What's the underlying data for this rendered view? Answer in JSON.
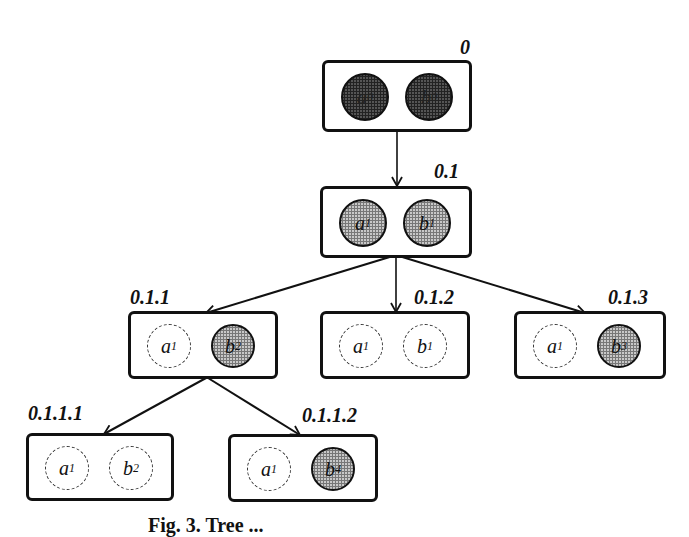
{
  "diagram": {
    "type": "tree",
    "nodes": [
      {
        "id": "0",
        "label": "0",
        "items": [
          {
            "var": "a",
            "sub": "0",
            "style": "dark"
          },
          {
            "var": "b",
            "sub": "0",
            "style": "dark"
          }
        ]
      },
      {
        "id": "0.1",
        "label": "0.1",
        "items": [
          {
            "var": "a",
            "sub": "1",
            "style": "light"
          },
          {
            "var": "b",
            "sub": "1",
            "style": "light"
          }
        ]
      },
      {
        "id": "0.1.1",
        "label": "0.1.1",
        "items": [
          {
            "var": "a",
            "sub": "1",
            "style": "dashed"
          },
          {
            "var": "b",
            "sub": "2",
            "style": "light"
          }
        ]
      },
      {
        "id": "0.1.2",
        "label": "0.1.2",
        "items": [
          {
            "var": "a",
            "sub": "1",
            "style": "dashed"
          },
          {
            "var": "b",
            "sub": "1",
            "style": "dashed"
          }
        ]
      },
      {
        "id": "0.1.3",
        "label": "0.1.3",
        "items": [
          {
            "var": "a",
            "sub": "1",
            "style": "dashed"
          },
          {
            "var": "b",
            "sub": "3",
            "style": "light"
          }
        ]
      },
      {
        "id": "0.1.1.1",
        "label": "0.1.1.1",
        "items": [
          {
            "var": "a",
            "sub": "1",
            "style": "dashed"
          },
          {
            "var": "b",
            "sub": "2",
            "style": "dashed"
          }
        ]
      },
      {
        "id": "0.1.1.2",
        "label": "0.1.1.2",
        "items": [
          {
            "var": "a",
            "sub": "1",
            "style": "dashed"
          },
          {
            "var": "b",
            "sub": "4",
            "style": "light"
          }
        ]
      }
    ],
    "edges": [
      {
        "from": "0",
        "to": "0.1"
      },
      {
        "from": "0.1",
        "to": "0.1.1"
      },
      {
        "from": "0.1",
        "to": "0.1.2"
      },
      {
        "from": "0.1",
        "to": "0.1.3"
      },
      {
        "from": "0.1.1",
        "to": "0.1.1.1"
      },
      {
        "from": "0.1.1",
        "to": "0.1.1.2"
      }
    ]
  },
  "labels": {
    "n0": "0",
    "n01": "0.1",
    "n011": "0.1.1",
    "n012": "0.1.2",
    "n013": "0.1.3",
    "n0111": "0.1.1.1",
    "n0112": "0.1.1.2"
  },
  "vars": {
    "a": "a",
    "b": "b",
    "s0": "0",
    "s1": "1",
    "s2": "2",
    "s3": "3",
    "s4": "4"
  },
  "caption": "Fig. 3. Tree ..."
}
